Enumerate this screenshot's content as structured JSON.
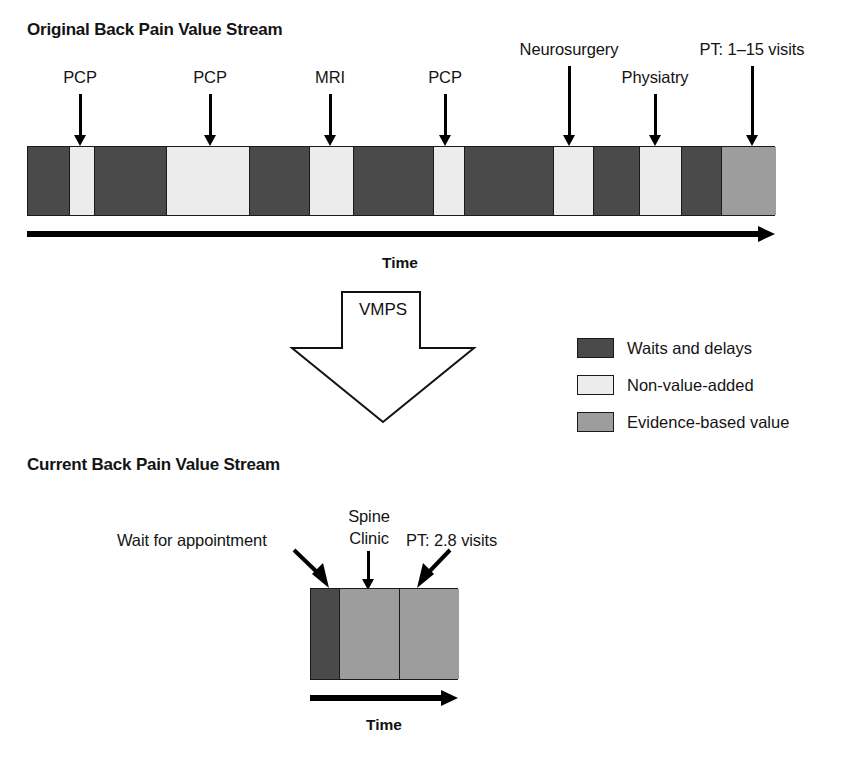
{
  "colors": {
    "waits_and_delays": "#4a4a4a",
    "non_value_added": "#ececec",
    "evidence_based_value": "#9d9d9d",
    "outline": "#1a1a1a",
    "text": "#141414"
  },
  "original": {
    "title": "Original Back Pain Value Stream",
    "callouts": [
      {
        "label": "PCP"
      },
      {
        "label": "PCP"
      },
      {
        "label": "MRI"
      },
      {
        "label": "PCP"
      },
      {
        "label": "Neurosurgery"
      },
      {
        "label": "Physiatry"
      },
      {
        "label": "PT: 1–15 visits"
      }
    ],
    "segments": [
      {
        "type": "waits_and_delays"
      },
      {
        "type": "non_value_added"
      },
      {
        "type": "waits_and_delays"
      },
      {
        "type": "non_value_added"
      },
      {
        "type": "waits_and_delays"
      },
      {
        "type": "non_value_added"
      },
      {
        "type": "waits_and_delays"
      },
      {
        "type": "non_value_added"
      },
      {
        "type": "waits_and_delays"
      },
      {
        "type": "non_value_added"
      },
      {
        "type": "waits_and_delays"
      },
      {
        "type": "non_value_added"
      },
      {
        "type": "waits_and_delays"
      },
      {
        "type": "evidence_based_value"
      }
    ],
    "axis_label": "Time"
  },
  "transform": {
    "label": "VMPS"
  },
  "legend": {
    "items": [
      {
        "label": "Waits and delays",
        "type": "waits_and_delays"
      },
      {
        "label": "Non-value-added",
        "type": "non_value_added"
      },
      {
        "label": "Evidence-based value",
        "type": "evidence_based_value"
      }
    ]
  },
  "current": {
    "title": "Current Back Pain Value Stream",
    "callouts": [
      {
        "label": "Wait for appointment"
      },
      {
        "label": "Spine\nClinic",
        "line1": "Spine",
        "line2": "Clinic"
      },
      {
        "label": "PT: 2.8 visits"
      }
    ],
    "segments": [
      {
        "type": "waits_and_delays"
      },
      {
        "type": "evidence_based_value"
      },
      {
        "type": "evidence_based_value"
      }
    ],
    "axis_label": "Time"
  }
}
